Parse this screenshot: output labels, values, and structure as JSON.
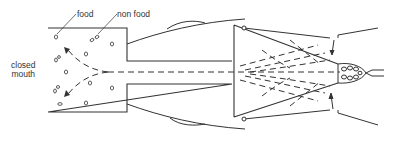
{
  "diagram": {
    "labels": {
      "food": "food",
      "non_food": "non food",
      "closed_mouth_line1": "closed",
      "closed_mouth_line2": "mouth"
    },
    "colors": {
      "stroke": "#333333",
      "background": "#ffffff"
    },
    "components": [
      "mouth-chamber",
      "narrow-channel",
      "triangular-filter-chamber",
      "dashed-flow-lines",
      "particle-cluster",
      "exit-duct",
      "body-outline-curves",
      "inward-arrows",
      "hinge-pivots"
    ]
  }
}
